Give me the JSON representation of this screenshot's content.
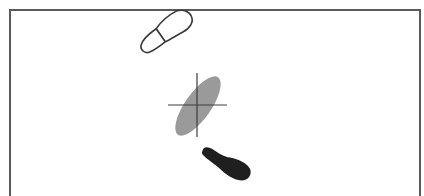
{
  "diagram": {
    "title": "Footstep trajectory with center of pressure",
    "colors": {
      "background": "#ffffff",
      "frame": "#5a5a5a",
      "outline_footprint_stroke": "#3a3a3a",
      "pressure_ellipse": "#9a9a9a",
      "crosshair": "#3c3c3c",
      "solid_footprint": "#1f1f1f"
    },
    "frame": {
      "x": 9,
      "y": 9,
      "right": 420,
      "stroke_width": 2
    },
    "elements": [
      {
        "id": "outline-footprint",
        "label": "Previous footstep (outline)",
        "center": [
          164,
          33
        ],
        "angle_deg": -35
      },
      {
        "id": "pressure-ellipse",
        "label": "Pressure area",
        "center": [
          198,
          106
        ],
        "rx": 34,
        "ry": 13,
        "angle_deg": -55
      },
      {
        "id": "crosshair",
        "label": "Center point",
        "center": [
          197,
          105
        ],
        "h_extent": [
          168,
          227
        ],
        "v_extent": [
          73,
          137
        ]
      },
      {
        "id": "solid-footprint",
        "label": "Next footstep (solid)",
        "center": [
          225,
          164
        ],
        "angle_deg": 25
      }
    ]
  }
}
